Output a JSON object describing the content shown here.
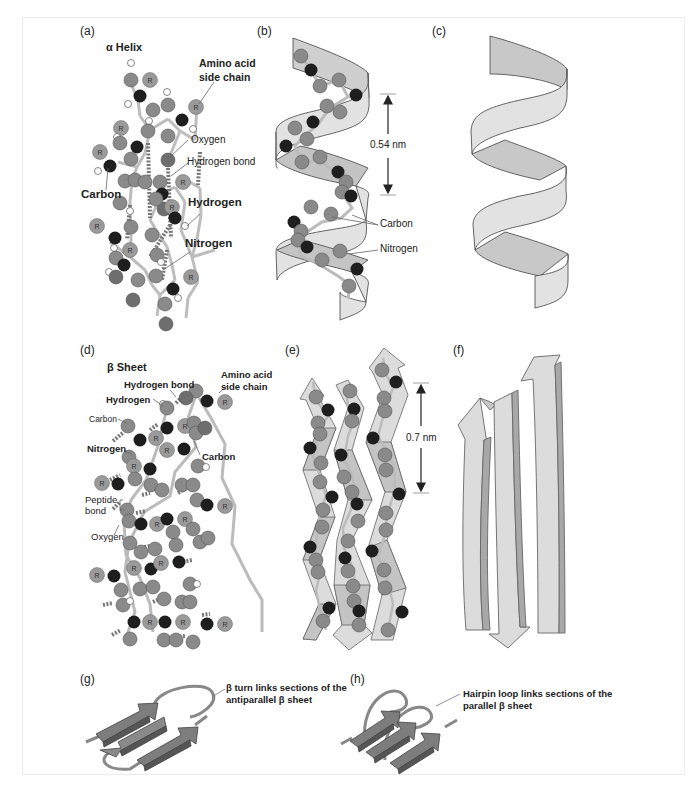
{
  "figure": {
    "panels": {
      "a": {
        "label": "(a)",
        "title": "α Helix",
        "callouts": {
          "side_chain": "Amino acid\nside chain",
          "side_chain_l1": "Amino acid",
          "side_chain_l2": "side chain",
          "oxygen": "Oxygen",
          "hydrogen_bond": "Hydrogen bond",
          "carbon": "Carbon",
          "hydrogen": "Hydrogen",
          "nitrogen": "Nitrogen"
        },
        "atom_marker": "R"
      },
      "b": {
        "label": "(b)",
        "measurement": "0.54 nm",
        "callouts": {
          "carbon": "Carbon",
          "nitrogen": "Nitrogen"
        }
      },
      "c": {
        "label": "(c)"
      },
      "d": {
        "label": "(d)",
        "title": "β Sheet",
        "callouts": {
          "side_chain_l1": "Amino acid",
          "side_chain_l2": "side chain",
          "hydrogen_bond": "Hydrogen bond",
          "hydrogen": "Hydrogen",
          "carbon_left": "Carbon",
          "nitrogen": "Nitrogen",
          "carbon_right": "Carbon",
          "peptide_l1": "Peptide",
          "peptide_l2": "bond",
          "oxygen": "Oxygen"
        }
      },
      "e": {
        "label": "(e)",
        "measurement": "0.7 nm"
      },
      "f": {
        "label": "(f)"
      },
      "g": {
        "label": "(g)",
        "caption_l1": "β turn links sections of the",
        "caption_l2": "antiparallel β sheet"
      },
      "h": {
        "label": "(h)",
        "caption_l1": "Hairpin loop links sections of the",
        "caption_l2": "parallel β sheet"
      }
    },
    "colors": {
      "background": "#ffffff",
      "frame_border": "#ececec",
      "ribbon_light": "#e4e4e4",
      "ribbon_dark": "#c4c4c4",
      "ribbon_edge": "#555555",
      "atom_carbon": "#8a8a8a",
      "atom_nitrogen": "#1e1e1e",
      "atom_oxygen": "#6e6e6e",
      "atom_hydrogen": "#ffffff",
      "atom_R": "#9a9a9a",
      "arrow_fill": "#7a7a7a",
      "text": "#222222"
    }
  }
}
